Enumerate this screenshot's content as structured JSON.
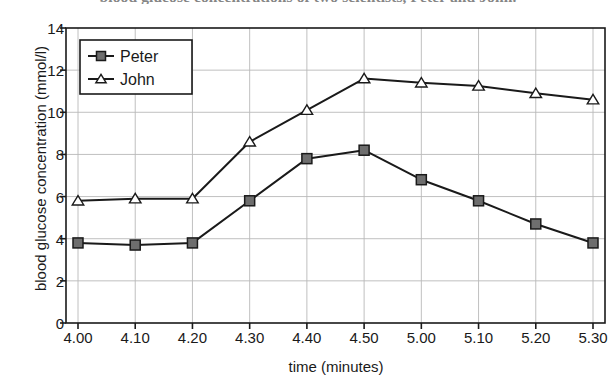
{
  "clipped_caption": "blood glucose concentrations of two scientists, Peter and John.",
  "chart_data": {
    "type": "line",
    "title": "",
    "xlabel": "time (minutes)",
    "ylabel": "blood glucose concentration (mmol/l)",
    "categories": [
      "4.00",
      "4.10",
      "4.20",
      "4.30",
      "4.40",
      "4.50",
      "5.00",
      "5.10",
      "5.20",
      "5.30"
    ],
    "xtick_labels": [
      "4.00",
      "4.10",
      "4.20",
      "4.30",
      "4.40",
      "4.50",
      "5.00",
      "5.10",
      "5.20",
      "5.30"
    ],
    "ytick_labels": [
      "0",
      "2",
      "4",
      "6",
      "8",
      "10",
      "12",
      "14"
    ],
    "ytick_values": [
      0,
      2,
      4,
      6,
      8,
      10,
      12,
      14
    ],
    "ylim": [
      0,
      14
    ],
    "grid": true,
    "legend_position": "top-left",
    "series": [
      {
        "name": "Peter",
        "marker": "square-filled",
        "color": "#1a1a1a",
        "marker_fill": "#6e6e6e",
        "values": [
          3.8,
          3.7,
          3.8,
          5.8,
          7.8,
          8.2,
          6.8,
          5.8,
          4.7,
          3.8
        ]
      },
      {
        "name": "John",
        "marker": "triangle-open",
        "color": "#1a1a1a",
        "marker_fill": "#ffffff",
        "values": [
          5.8,
          5.9,
          5.9,
          8.6,
          10.1,
          11.6,
          11.4,
          11.25,
          10.9,
          10.6
        ]
      }
    ]
  }
}
